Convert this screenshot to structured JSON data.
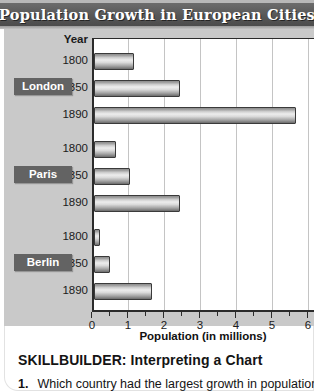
{
  "header": {
    "title": "Population Growth in European Cities"
  },
  "labels": {
    "year_header": "Year",
    "axis_title": "Population (in millions)"
  },
  "cities": [
    {
      "name": "London",
      "years": [
        "1800",
        "1850",
        "1890"
      ],
      "values": [
        1.1,
        2.4,
        5.6
      ]
    },
    {
      "name": "Paris",
      "years": [
        "1800",
        "1850",
        "1890"
      ],
      "values": [
        0.6,
        1.0,
        2.4
      ]
    },
    {
      "name": "Berlin",
      "years": [
        "1800",
        "1850",
        "1890"
      ],
      "values": [
        0.17,
        0.45,
        1.6
      ]
    }
  ],
  "xaxis": {
    "ticks": [
      "0",
      "1",
      "2",
      "3",
      "4",
      "5",
      "6"
    ]
  },
  "footer": {
    "skillbuilder": "SKILLBUILDER: Interpreting a Chart",
    "question_number": "1.",
    "question_text": "Which country had the largest growth in population?"
  },
  "colors": {
    "banner": "#575757",
    "panel": "#c9c9c9",
    "badge": "#636363",
    "axis": "#2b2b2b",
    "grid": "#c4c4c4"
  },
  "chart_data": {
    "type": "bar",
    "orientation": "horizontal",
    "title": "Population Growth in European Cities",
    "xlabel": "Population (in millions)",
    "ylabel": "Year",
    "xlim": [
      0,
      6
    ],
    "grid": true,
    "legend": "none",
    "categories": [
      "London 1800",
      "London 1850",
      "London 1890",
      "Paris 1800",
      "Paris 1850",
      "Paris 1890",
      "Berlin 1800",
      "Berlin 1850",
      "Berlin 1890"
    ],
    "values": [
      1.1,
      2.4,
      5.6,
      0.6,
      1.0,
      2.4,
      0.17,
      0.45,
      1.6
    ],
    "series": [
      {
        "name": "London",
        "x": [
          "1800",
          "1850",
          "1890"
        ],
        "values": [
          1.1,
          2.4,
          5.6
        ]
      },
      {
        "name": "Paris",
        "x": [
          "1800",
          "1850",
          "1890"
        ],
        "values": [
          0.6,
          1.0,
          2.4
        ]
      },
      {
        "name": "Berlin",
        "x": [
          "1800",
          "1850",
          "1890"
        ],
        "values": [
          0.17,
          0.45,
          1.6
        ]
      }
    ],
    "xticks": [
      0,
      1,
      2,
      3,
      4,
      5,
      6
    ]
  }
}
